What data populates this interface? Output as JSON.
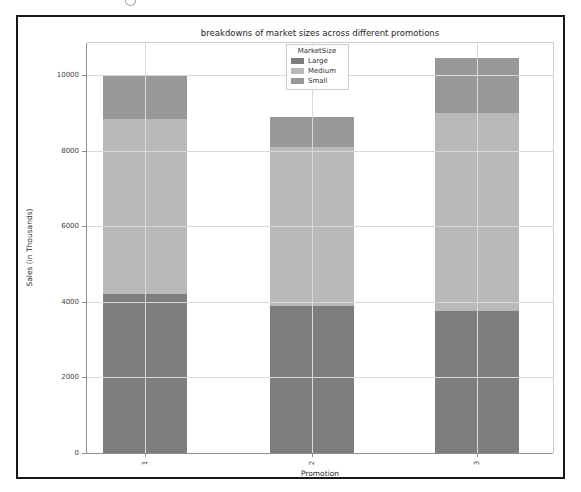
{
  "figure": {
    "frame_border_color": "#181818",
    "background": "#ffffff",
    "grid_color": "#d9d9d9",
    "spine_color": "#8f8f8f",
    "tick_label_color": "#444444"
  },
  "chart_data": {
    "type": "bar",
    "stacked": true,
    "title": "breakdowns of market sizes across different promotions",
    "xlabel": "Promotion",
    "ylabel": "Sales (in Thousands)",
    "categories": [
      "1",
      "2",
      "3"
    ],
    "series": [
      {
        "name": "Large",
        "color": "#7d7d7d",
        "values": [
          4200,
          3900,
          3750
        ]
      },
      {
        "name": "Medium",
        "color": "#b9b9b9",
        "values": [
          4650,
          4200,
          5250
        ]
      },
      {
        "name": "Small",
        "color": "#989898",
        "values": [
          1150,
          800,
          1450
        ]
      }
    ],
    "bar_totals": [
      10000,
      8900,
      10450
    ],
    "legend": {
      "title": "MarketSize",
      "position": "upper center",
      "entries": [
        "Large",
        "Medium",
        "Small"
      ]
    },
    "yticks": [
      0,
      2000,
      4000,
      6000,
      8000,
      10000
    ],
    "ylim": [
      0,
      10850
    ],
    "grid": true,
    "xtick_rotation": 90
  }
}
